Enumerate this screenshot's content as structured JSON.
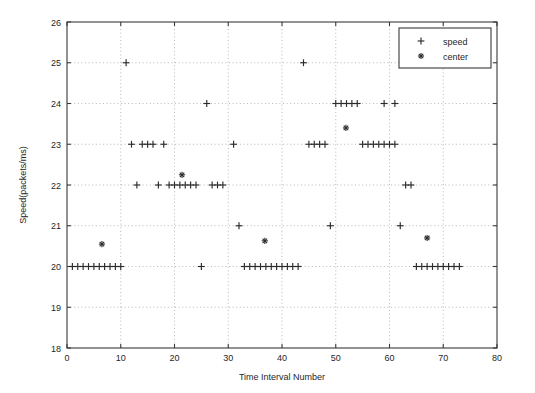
{
  "chart_data": {
    "type": "scatter",
    "title": "",
    "xlabel": "Time Interval Number",
    "ylabel": "Speed(packets/ms)",
    "xlim": [
      0,
      80
    ],
    "ylim": [
      18,
      26
    ],
    "xticks": [
      0,
      10,
      20,
      30,
      40,
      50,
      60,
      70,
      80
    ],
    "yticks": [
      18,
      19,
      20,
      21,
      22,
      23,
      24,
      25,
      26
    ],
    "xtick_labels": [
      "0",
      "10",
      "20",
      "30",
      "40",
      "50",
      "60",
      "70",
      "80"
    ],
    "ytick_labels": [
      "18",
      "19",
      "20",
      "21",
      "22",
      "23",
      "24",
      "25",
      "26"
    ],
    "grid": true,
    "legend_position": "upper-right",
    "series": [
      {
        "name": "speed",
        "marker": "plus",
        "color": "#2b2b2b",
        "x": [
          1,
          2,
          3,
          4,
          5,
          6,
          7,
          8,
          9,
          10,
          11,
          12,
          14,
          15,
          16,
          18,
          13,
          17,
          19,
          20,
          21,
          22,
          23,
          24,
          25,
          26,
          27,
          28,
          29,
          31,
          32,
          33,
          34,
          35,
          36,
          37,
          38,
          39,
          40,
          41,
          42,
          43,
          44,
          45,
          46,
          47,
          48,
          49,
          50,
          51,
          52,
          53,
          54,
          55,
          56,
          57,
          58,
          59,
          60,
          61,
          59,
          61,
          62,
          63,
          64,
          65,
          66,
          67,
          68,
          69,
          70,
          71,
          72,
          73
        ],
        "y": [
          20,
          20,
          20,
          20,
          20,
          20,
          20,
          20,
          20,
          20,
          25,
          23,
          23,
          23,
          23,
          23,
          22,
          22,
          22,
          22,
          22,
          22,
          22,
          22,
          20,
          24,
          22,
          22,
          22,
          23,
          21,
          20,
          20,
          20,
          20,
          20,
          20,
          20,
          20,
          20,
          20,
          20,
          25,
          23,
          23,
          23,
          23,
          21,
          24,
          24,
          24,
          24,
          24,
          23,
          23,
          23,
          23,
          23,
          23,
          23,
          24,
          24,
          21,
          22,
          22,
          20,
          20,
          20,
          20,
          20,
          20,
          20,
          20,
          20
        ]
      },
      {
        "name": "center",
        "marker": "star",
        "color": "#2b2b2b",
        "x": [
          6.5,
          21.4,
          36.8,
          51.9,
          67.0
        ],
        "y": [
          20.55,
          22.25,
          20.63,
          23.4,
          20.7
        ]
      }
    ],
    "legend_entries": [
      {
        "label": "speed",
        "marker": "plus"
      },
      {
        "label": "center",
        "marker": "star"
      }
    ]
  },
  "axis_titles": {
    "x": "Time Interval Number",
    "y": "Speed(packets/ms)"
  }
}
